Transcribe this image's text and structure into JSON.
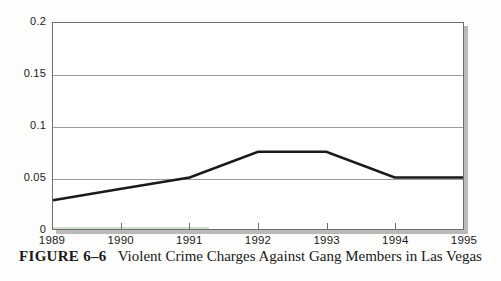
{
  "caption": {
    "label": "FIGURE 6–6",
    "title": "Violent Crime Charges Against Gang Members in Las Vegas"
  },
  "colors": {
    "line": "#1a1a1a",
    "gridline": "#9a9a9a",
    "axis": "#6e6e6e",
    "plot_background": "#ffffff",
    "page_background": "#fdfdfb",
    "shadow": "#b9b9b9"
  },
  "chart_data": {
    "type": "line",
    "title": "Violent Crime Charges Against Gang Members in Las Vegas",
    "xlabel": "",
    "ylabel": "",
    "x": [
      1989,
      1990,
      1991,
      1992,
      1993,
      1994,
      1995
    ],
    "xtick_labels": [
      "1989",
      "1990",
      "1991",
      "1992",
      "1993",
      "1994",
      "1995"
    ],
    "ytick_labels": [
      "0",
      "0.05",
      "0.1",
      "0.15",
      "0.2"
    ],
    "yticks": [
      0,
      0.05,
      0.1,
      0.15,
      0.2
    ],
    "ylim": [
      0,
      0.2
    ],
    "xlim": [
      1989,
      1995
    ],
    "grid": "horizontal",
    "legend": "none",
    "series": [
      {
        "name": "Violent crime charges",
        "values": [
          0.028,
          0.039,
          0.05,
          0.075,
          0.075,
          0.05,
          0.05
        ]
      }
    ]
  }
}
